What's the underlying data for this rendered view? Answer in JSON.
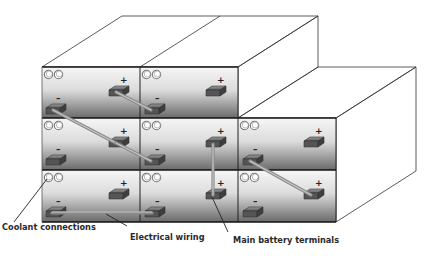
{
  "diagram": {
    "type": "battery-pack-module-layout",
    "layout": {
      "columns": 3,
      "rows": 3,
      "front_face": {
        "left": 42,
        "col_dividers": [
          140,
          238
        ],
        "right": 336,
        "row_tops": [
          67,
          118,
          170
        ],
        "bottom": 222
      },
      "depth_offset": {
        "dx": 80,
        "dy": -51
      }
    },
    "modules": [
      {
        "id": "r1c1",
        "row": 1,
        "col": 1,
        "coolant_ports": 2,
        "positive_terminal": "+",
        "negative_terminal": "–"
      },
      {
        "id": "r1c2",
        "row": 1,
        "col": 2,
        "coolant_ports": 2,
        "positive_terminal": "+",
        "negative_terminal": "–"
      },
      {
        "id": "r2c1",
        "row": 2,
        "col": 1,
        "coolant_ports": 2,
        "positive_terminal": "+",
        "negative_terminal": "–"
      },
      {
        "id": "r2c2",
        "row": 2,
        "col": 2,
        "coolant_ports": 2,
        "positive_terminal": "+",
        "negative_terminal": "–"
      },
      {
        "id": "r2c3",
        "row": 2,
        "col": 3,
        "coolant_ports": 2,
        "positive_terminal": "+",
        "negative_terminal": "–"
      },
      {
        "id": "r3c1",
        "row": 3,
        "col": 1,
        "coolant_ports": 2,
        "positive_terminal": "+",
        "negative_terminal": "–"
      },
      {
        "id": "r3c2",
        "row": 3,
        "col": 2,
        "coolant_ports": 2,
        "positive_terminal": "+",
        "negative_terminal": "–"
      },
      {
        "id": "r3c3",
        "row": 3,
        "col": 3,
        "coolant_ports": 2,
        "positive_terminal": "+",
        "negative_terminal": "–"
      }
    ],
    "labels": {
      "coolant": "Coolant connections",
      "wiring": "Electrical wiring",
      "terminals": "Main battery terminals"
    },
    "signs": {
      "positive": "+",
      "negative": "–"
    },
    "colors": {
      "face_light": "#f4f4f4",
      "face_dark": "#6f6f6f",
      "top_light": "#f2f2f2",
      "top_dark": "#555555",
      "terminal": "#5a5a5a",
      "wire": "#8a8a8a",
      "outline": "#111111"
    }
  }
}
